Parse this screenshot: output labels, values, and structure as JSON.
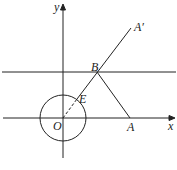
{
  "diagram": {
    "labels": {
      "y": "y",
      "x": "x",
      "O": "O",
      "E": "E",
      "B": "B",
      "A": "A",
      "A_prime": "A′"
    },
    "caption": "图 1-2"
  }
}
